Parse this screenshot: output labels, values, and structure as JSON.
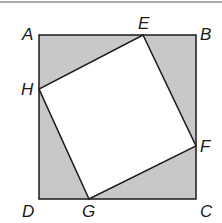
{
  "diagram": {
    "type": "geometry-figure",
    "colors": {
      "shade": "#c8c8c8",
      "stroke": "#1a1a1a",
      "inner": "#ffffff",
      "top_rule": "#555555"
    },
    "points": {
      "A": {
        "label": "A",
        "x": 39,
        "y": 35
      },
      "B": {
        "label": "B",
        "x": 196,
        "y": 35
      },
      "C": {
        "label": "C",
        "x": 196,
        "y": 199
      },
      "D": {
        "label": "D",
        "x": 39,
        "y": 199
      },
      "E": {
        "label": "E",
        "x": 143,
        "y": 35
      },
      "F": {
        "label": "F",
        "x": 196,
        "y": 146
      },
      "G": {
        "label": "G",
        "x": 89,
        "y": 199
      },
      "H": {
        "label": "H",
        "x": 39,
        "y": 89
      }
    },
    "outer_square": [
      "A",
      "B",
      "C",
      "D"
    ],
    "inner_square": [
      "E",
      "F",
      "G",
      "H"
    ],
    "shaded_regions": [
      [
        "A",
        "E",
        "H"
      ],
      [
        "E",
        "B",
        "F"
      ],
      [
        "F",
        "C",
        "G"
      ],
      [
        "G",
        "D",
        "H"
      ]
    ]
  }
}
